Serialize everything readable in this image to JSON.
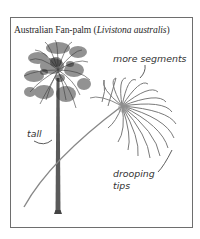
{
  "figure": {
    "title_common": "Australian Fan-palm (",
    "title_scientific": "Livistona australis",
    "title_close": ")",
    "labels": {
      "more_segments": "more segments",
      "tall": "tall",
      "drooping_line1": "drooping",
      "drooping_line2": "tips"
    },
    "colors": {
      "frame": "#6e6e6e",
      "foliage": "#3a3a3a",
      "trunk": "#555555",
      "leaf": "#7a7a7a",
      "text": "#333333"
    }
  }
}
